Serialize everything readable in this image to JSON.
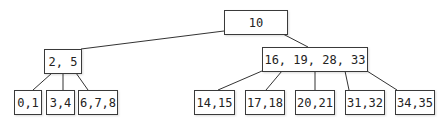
{
  "diagram": {
    "type": "b-tree",
    "root": {
      "label": "10"
    },
    "internal": [
      {
        "label": "2, 5"
      },
      {
        "label": "16, 19, 28, 33"
      }
    ],
    "leaves": [
      {
        "label": "0,1"
      },
      {
        "label": "3,4"
      },
      {
        "label": "6,7,8"
      },
      {
        "label": "14,15"
      },
      {
        "label": "17,18"
      },
      {
        "label": "20,21"
      },
      {
        "label": "31,32"
      },
      {
        "label": "34,35"
      }
    ],
    "edges": [
      [
        "10",
        "2, 5"
      ],
      [
        "10",
        "16, 19, 28, 33"
      ],
      [
        "2, 5",
        "0,1"
      ],
      [
        "2, 5",
        "3,4"
      ],
      [
        "2, 5",
        "6,7,8"
      ],
      [
        "16, 19, 28, 33",
        "14,15"
      ],
      [
        "16, 19, 28, 33",
        "17,18"
      ],
      [
        "16, 19, 28, 33",
        "20,21"
      ],
      [
        "16, 19, 28, 33",
        "31,32"
      ],
      [
        "16, 19, 28, 33",
        "34,35"
      ]
    ]
  }
}
